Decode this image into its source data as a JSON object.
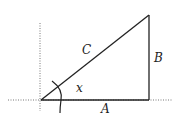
{
  "diagram": {
    "type": "right-triangle",
    "labels": {
      "hypotenuse": "C",
      "vertical_side": "B",
      "horizontal_side": "A",
      "angle": "x"
    },
    "colors": {
      "line": "#222222",
      "axis": "#777777"
    }
  }
}
